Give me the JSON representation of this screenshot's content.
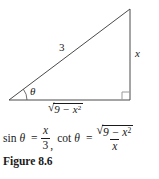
{
  "colors": {
    "background": "#ffffff",
    "triangle_line": "#4a4a4a",
    "right_angle_marker": "#9a9a9a",
    "text": "#1a1a1a"
  },
  "diagram": {
    "hypotenuse_label": "3",
    "opposite_label": "x",
    "angle_label": "θ",
    "base_label": {
      "sign": "√",
      "radicand": "9 − x",
      "exponent": "2"
    }
  },
  "equation": {
    "sin_fn": "sin",
    "sin_angle": "θ",
    "sin_eq": "=",
    "sin_numerator": "x",
    "sin_denominator": "3",
    "separator": ",",
    "cot_fn": "cot",
    "cot_angle": "θ",
    "cot_eq": "=",
    "cot_num": {
      "sign": "√",
      "radicand": "9 − x",
      "exponent": "2"
    },
    "cot_denominator": "x"
  },
  "caption": "Figure 8.6"
}
